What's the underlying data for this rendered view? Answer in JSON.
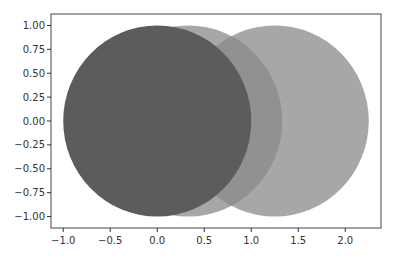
{
  "chart_data": {
    "type": "scatter",
    "subtype": "circles",
    "title": "",
    "xlabel": "",
    "ylabel": "",
    "xlim": [
      -1.13,
      2.38
    ],
    "ylim": [
      -1.12,
      1.12
    ],
    "grid": false,
    "legend": null,
    "x_ticks": [
      -1.0,
      -0.5,
      0.0,
      0.5,
      1.0,
      1.5,
      2.0
    ],
    "x_tick_labels": [
      "−1.0",
      "−0.5",
      "0.0",
      "0.5",
      "1.0",
      "1.5",
      "2.0"
    ],
    "y_ticks": [
      1.0,
      0.75,
      0.5,
      0.25,
      0.0,
      -0.25,
      -0.5,
      -0.75,
      -1.0
    ],
    "y_tick_labels": [
      "1.00",
      "0.75",
      "0.50",
      "0.25",
      "0.00",
      "−0.25",
      "−0.50",
      "−0.75",
      "−1.00"
    ],
    "series": [
      {
        "name": "circle-middle",
        "center": [
          0.33,
          0.0
        ],
        "radius": 1.0,
        "color": "#8a8a8a",
        "alpha": 0.75
      },
      {
        "name": "circle-right",
        "center": [
          1.25,
          0.0
        ],
        "radius": 1.0,
        "color": "#8a8a8a",
        "alpha": 0.75
      },
      {
        "name": "circle-left",
        "center": [
          0.0,
          0.0
        ],
        "radius": 1.0,
        "color": "#5c5c5c",
        "alpha": 1.0
      }
    ]
  },
  "colors": {
    "axes": "#333333",
    "background": "#ffffff"
  }
}
